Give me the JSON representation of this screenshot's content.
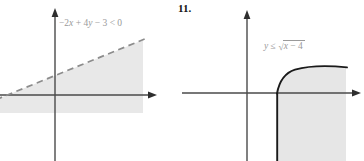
{
  "figure": {
    "panels": [
      {
        "id": "left",
        "problem_number": "",
        "equation_label": {
          "full_text": "-2x + 4y - 3 < 0",
          "parts": {
            "t1": "−2",
            "v1": "x",
            "t2": "+ 4",
            "v2": "y",
            "t3": "− 3 < 0"
          }
        },
        "graph": {
          "type": "linear-inequality",
          "boundary_style": "dashed",
          "boundary_color": "#8c8c8c",
          "shade_color": "#e8e8e8",
          "shaded_side": "below-boundary-line",
          "axes": {
            "x_axis_y": 95,
            "y_axis_x": 55,
            "axis_color": "#4a4a4a",
            "x_arrow_tip_x": 155,
            "y_arrow_tip_y": 10
          },
          "boundary_points": [
            [
              0,
              98
            ],
            [
              143,
              40
            ]
          ],
          "shade_extent": {
            "x_min": 0,
            "x_max": 143,
            "y_max": 113
          }
        }
      },
      {
        "id": "right",
        "problem_number": "11.",
        "equation_label": {
          "full_text": "y ≤ √(x − 4)",
          "parts": {
            "v1": "y",
            "rel": "≤",
            "radical_vee": "√",
            "radicand_var": "x",
            "radicand_rest": "− 4"
          }
        },
        "graph": {
          "type": "radical-inequality",
          "boundary_style": "solid",
          "boundary_color": "#1a1a1a",
          "shade_color": "#e6e6e6",
          "shaded_side": "below-curve-right-of-x-equals-4",
          "axes": {
            "x_axis_y": 93,
            "y_axis_x": 247,
            "axis_color": "#4a4a4a",
            "x_arrow_tip_x": 360,
            "y_arrow_tip_y": 12
          },
          "curve_start": [
            277,
            93
          ],
          "curve_end": [
            347,
            68
          ],
          "vertical_edge_x": 277,
          "shade_extent": {
            "x_min": 277,
            "x_max": 346,
            "y_max": 161
          }
        }
      }
    ]
  }
}
